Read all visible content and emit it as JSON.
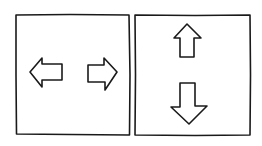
{
  "diagram": {
    "panels": [
      {
        "name": "horizontal-panel",
        "arrows": [
          {
            "direction": "left",
            "icon": "arrow-left-icon"
          },
          {
            "direction": "right",
            "icon": "arrow-right-icon"
          }
        ]
      },
      {
        "name": "vertical-panel",
        "arrows": [
          {
            "direction": "up",
            "icon": "arrow-up-icon"
          },
          {
            "direction": "down",
            "icon": "arrow-down-icon"
          }
        ]
      }
    ],
    "colors": {
      "stroke": "#1a1a1a",
      "background": "#ffffff"
    }
  }
}
